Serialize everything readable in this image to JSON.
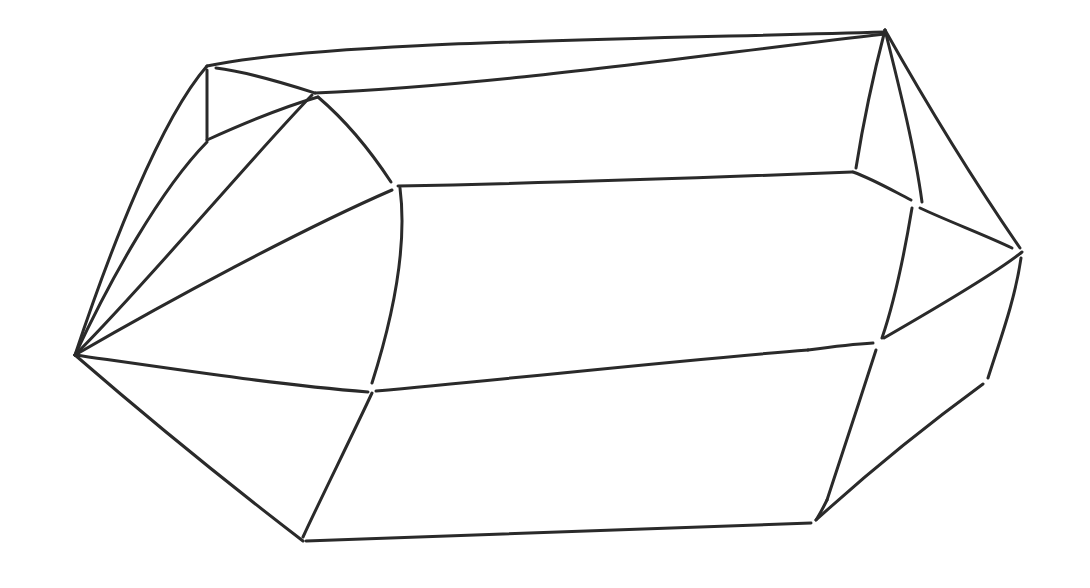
{
  "figure": {
    "type": "line-drawing",
    "background_color": "#ffffff",
    "stroke_color": "#2a2a2a",
    "stroke_width": 3,
    "edges": [
      "M75,355 C110,250 160,120 207,66",
      "M207,66 C320,42 600,40 885,32",
      "M216,68 C250,72 290,85 315,93",
      "M207,70 L207,140",
      "M207,140 C240,125 280,108 318,97",
      "M315,93 C500,85 700,55 885,34",
      "M75,355 C110,280 160,190 207,142",
      "M75,355 C150,280 240,170 312,95",
      "M318,97 C345,120 370,150 391,182",
      "M75,355 C170,300 300,230 392,190",
      "M398,186 C550,183 700,178 852,172",
      "M400,188 C408,250 392,320 372,383",
      "M75,355 C180,370 280,385 368,392",
      "M75,355 C150,420 230,485 303,541",
      "M372,393 C350,440 320,500 303,537",
      "M376,391 C520,378 680,360 808,350",
      "M808,350 C830,347 855,344 873,343",
      "M306,541 C480,536 650,530 811,523",
      "M885,30 C872,80 862,130 856,168",
      "M885,30 C900,90 915,150 922,202",
      "M885,30 C930,110 980,190 1020,248",
      "M853,172 C875,180 895,192 911,200",
      "M920,208 C950,222 985,235 1012,248",
      "M1022,252 C1000,270 950,300 884,338",
      "M912,208 C905,250 895,300 882,338",
      "M1021,258 C1015,300 1000,340 988,378",
      "M876,350 C860,400 840,460 827,500",
      "M827,500 C822,510 818,517 816,520",
      "M983,384 C920,430 860,480 816,520"
    ]
  }
}
